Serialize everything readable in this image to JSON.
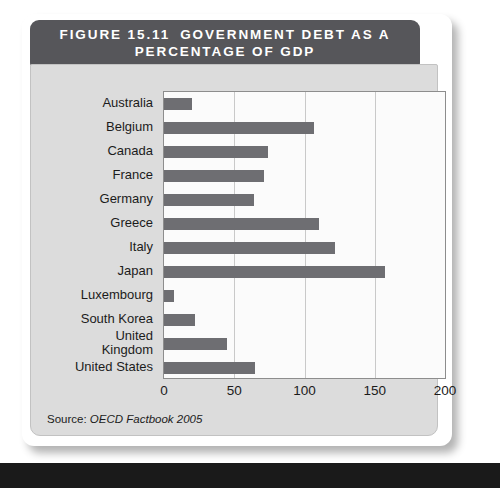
{
  "figure": {
    "number_label": "FIGURE 15.11",
    "title_line1": "GOVERNMENT DEBT AS A",
    "title_line2": "PERCENTAGE OF GDP",
    "source_label": "Source:",
    "source_value": "OECD Factbook 2005",
    "header_bg": "#56565a",
    "header_text_color": "#ffffff",
    "body_bg": "#dcdcdc",
    "plot_bg": "#fbfbfb",
    "bar_color": "#6e6e72",
    "gridline_color": "#c9c9c9",
    "axis_color": "#8d8d8d"
  },
  "chart_data": {
    "type": "bar",
    "orientation": "horizontal",
    "title": "GOVERNMENT DEBT AS A PERCENTAGE OF GDP",
    "xlabel": "",
    "ylabel": "",
    "xlim": [
      0,
      200
    ],
    "xticks": [
      0,
      50,
      100,
      150,
      200
    ],
    "grid": true,
    "legend": false,
    "categories": [
      "Australia",
      "Belgium",
      "Canada",
      "France",
      "Germany",
      "Greece",
      "Italy",
      "Japan",
      "Luxembourg",
      "South Korea",
      "United\nKingdom",
      "United States"
    ],
    "values": [
      20,
      107,
      74,
      71,
      64,
      110,
      122,
      157,
      7,
      22,
      45,
      65
    ],
    "annotations": [
      "Source: OECD Factbook 2005"
    ]
  }
}
